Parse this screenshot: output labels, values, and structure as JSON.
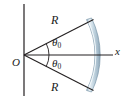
{
  "figure": {
    "type": "geometry-diagram",
    "background_color": "#ffffff",
    "line_color": "#231f20",
    "arc_band": {
      "fill_color": "#c6d7e2",
      "highlight_color": "#eef4f8",
      "edge_color": "#7d98ab",
      "radius": 78,
      "band_thickness": 6
    },
    "labels": {
      "radius_upper": "R",
      "radius_lower": "R",
      "origin": "O",
      "x_axis": "x",
      "angle_upper_symbol": "θ",
      "angle_upper_subscript": "0",
      "angle_lower_symbol": "θ",
      "angle_lower_subscript": "0"
    },
    "geometry": {
      "origin_x": 24,
      "origin_y": 55,
      "y_axis_top": 4,
      "y_axis_bottom": 96,
      "x_axis_end": 113,
      "half_angle_degrees": 27,
      "radius_length_px": 78,
      "angle_marker_radius_upper": 25,
      "angle_marker_radius_lower": 25
    }
  }
}
